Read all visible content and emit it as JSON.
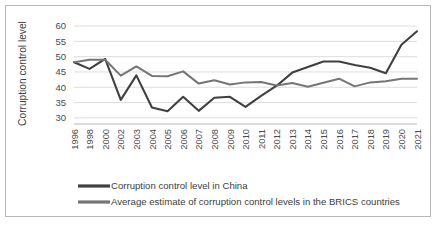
{
  "chart_data": {
    "type": "line",
    "title": "",
    "xlabel": "",
    "ylabel": "Corruption control level",
    "ylim": [
      28,
      61
    ],
    "yticks": [
      30,
      35,
      40,
      45,
      50,
      55,
      60
    ],
    "ytick_labels": [
      "30",
      "35",
      "40",
      "45",
      "50",
      "55",
      "60"
    ],
    "grid": true,
    "legend_position": "bottom",
    "categories": [
      "1996",
      "1998",
      "2000",
      "2002",
      "2003",
      "2004",
      "2005",
      "2006",
      "2007",
      "2008",
      "2009",
      "2010",
      "2011",
      "2012",
      "2013",
      "2014",
      "2015",
      "2016",
      "2017",
      "2018",
      "2019",
      "2020",
      "2021"
    ],
    "series": [
      {
        "name": "Corruption control level in China",
        "color": "#404040",
        "values": [
          48.2,
          46.0,
          49.3,
          35.9,
          43.9,
          33.4,
          32.2,
          36.9,
          32.3,
          36.6,
          36.9,
          33.6,
          37.2,
          40.5,
          44.8,
          46.6,
          48.4,
          48.4,
          47.3,
          46.4,
          44.6,
          53.9,
          58.3
        ]
      },
      {
        "name": "Average estimate of corruption control levels in the BRICS countries",
        "color": "#757575",
        "values": [
          48.2,
          49.0,
          49.0,
          43.8,
          46.8,
          43.7,
          43.6,
          45.2,
          41.2,
          42.3,
          40.9,
          41.6,
          41.7,
          40.6,
          41.4,
          40.2,
          41.5,
          42.8,
          40.3,
          41.6,
          42.0,
          42.8,
          42.8
        ]
      }
    ]
  },
  "axis": {
    "y_title": "Corruption control level"
  },
  "legend": {
    "items": [
      {
        "label": "Corruption control level in China",
        "color": "#404040"
      },
      {
        "label": "Average estimate of corruption control levels in the BRICS countries",
        "color": "#757575"
      }
    ]
  },
  "colors": {
    "china_line": "#404040",
    "brics_line": "#757575",
    "gridline": "#d4d4d4",
    "frame_border": "#b8b8b8",
    "background": "#ffffff",
    "text": "#4a4a4a"
  }
}
